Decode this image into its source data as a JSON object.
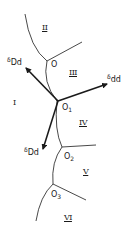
{
  "diagram": {
    "type": "grain-boundary-vector-diagram",
    "regions": [
      "I",
      "II",
      "III",
      "IV",
      "V",
      "VI"
    ],
    "junctions": [
      {
        "base": "O",
        "sub": ""
      },
      {
        "base": "O",
        "sub": "1"
      },
      {
        "base": "O",
        "sub": "2"
      },
      {
        "base": "O",
        "sub": "3"
      }
    ],
    "vectors": [
      {
        "symbol": "δ",
        "sub": "Dd",
        "direction": "upper-left"
      },
      {
        "symbol": "δ",
        "sub": "dd",
        "direction": "right"
      },
      {
        "symbol": "δ",
        "sub": "Dd",
        "direction": "lower-left"
      }
    ],
    "colors": {
      "line": "#1a1a1a",
      "background": "#ffffff"
    }
  }
}
